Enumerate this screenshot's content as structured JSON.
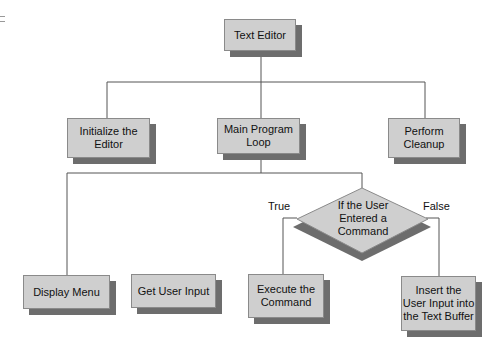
{
  "diagram": {
    "root": {
      "label": "Text Editor"
    },
    "level1": [
      {
        "label": "Initialize the Editor"
      },
      {
        "label": "Main Program Loop"
      },
      {
        "label": "Perform Cleanup"
      }
    ],
    "decision": {
      "label": "If the User Entered a Command",
      "true_label": "True",
      "false_label": "False"
    },
    "level2": [
      {
        "label": "Display Menu"
      },
      {
        "label": "Get User Input"
      },
      {
        "label": "Execute the Command"
      },
      {
        "label": "Insert the User Input into the Text Buffer"
      }
    ]
  }
}
